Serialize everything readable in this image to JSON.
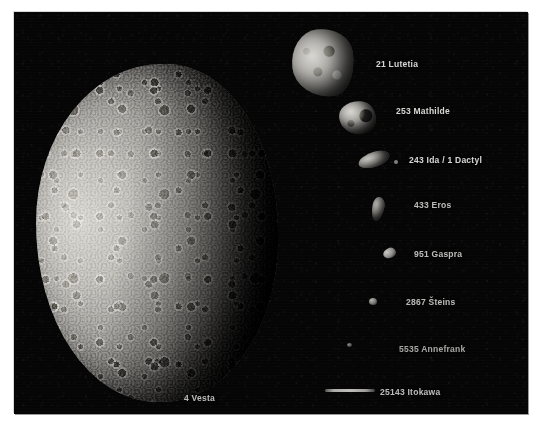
{
  "figure": {
    "kind": "asteroid-size-comparison-photo-montage",
    "background_color": "#050506",
    "label_color": "#e7e7e4",
    "frame_border_color": "#d8d8d8"
  },
  "bodies": [
    {
      "id": "vesta",
      "label": "4 Vesta",
      "icon": "asteroid-vesta-icon",
      "rank": 1
    },
    {
      "id": "lutetia",
      "label": "21 Lutetia",
      "icon": "asteroid-lutetia-icon",
      "rank": 2
    },
    {
      "id": "mathilde",
      "label": "253 Mathilde",
      "icon": "asteroid-mathilde-icon",
      "rank": 3
    },
    {
      "id": "ida",
      "label": "243 Ida / 1 Dactyl",
      "icon": "asteroid-ida-dactyl-icon",
      "rank": 4
    },
    {
      "id": "eros",
      "label": "433 Eros",
      "icon": "asteroid-eros-icon",
      "rank": 5
    },
    {
      "id": "gaspra",
      "label": "951 Gaspra",
      "icon": "asteroid-gaspra-icon",
      "rank": 6
    },
    {
      "id": "steins",
      "label": "2867 Šteins",
      "icon": "asteroid-steins-icon",
      "rank": 7
    },
    {
      "id": "annefrank",
      "label": "5535 Annefrank",
      "icon": "asteroid-annefrank-icon",
      "rank": 8
    },
    {
      "id": "itokawa",
      "label": "25143 Itokawa",
      "icon": "asteroid-itokawa-icon",
      "rank": 9
    }
  ],
  "labels": {
    "vesta": "4 Vesta",
    "lutetia": "21 Lutetia",
    "mathilde": "253 Mathilde",
    "ida": "243 Ida / 1 Dactyl",
    "eros": "433 Eros",
    "gaspra": "951 Gaspra",
    "steins": "2867 Šteins",
    "annefrank": "5535 Annefrank",
    "itokawa": "25143 Itokawa"
  }
}
